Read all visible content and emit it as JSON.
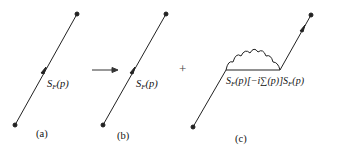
{
  "diagrams": {
    "a": {
      "caption": "(a)",
      "label": {
        "main": "S",
        "sub": "F",
        "arg": "(p)"
      }
    },
    "b": {
      "caption": "(b)",
      "label": {
        "main": "S",
        "sub": "F",
        "arg": "(p)"
      }
    },
    "c": {
      "caption": "(c)",
      "label": {
        "s1": "S",
        "s1_sub": "F",
        "s1_arg": "(p)",
        "mid": "[−i∑(p)]",
        "s2": "S",
        "s2_sub": "F",
        "s2_arg": "(p)"
      }
    }
  },
  "operators": {
    "arrow": "right-arrow",
    "plus": "+"
  },
  "colors": {
    "line": "#222222",
    "background": "#ffffff"
  }
}
